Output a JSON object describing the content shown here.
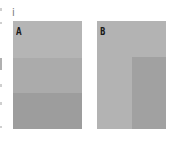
{
  "figure": {
    "index_label": "i",
    "panels": [
      {
        "label": "A",
        "bands": [
          {
            "top": 0,
            "height": 37,
            "color": "#b5b5b5"
          },
          {
            "top": 37,
            "height": 35,
            "color": "#ababab"
          },
          {
            "top": 72,
            "height": 36,
            "color": "#9d9d9d"
          }
        ]
      },
      {
        "label": "B",
        "background": "#b3b3b3",
        "region": {
          "left": 35,
          "top": 36,
          "width": 34,
          "height": 72,
          "color": "#a1a1a1"
        }
      }
    ]
  }
}
